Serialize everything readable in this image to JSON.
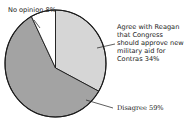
{
  "chart_data": {
    "type": "pie",
    "title": "",
    "start_angle_deg": 0,
    "direction": "clockwise",
    "slices": [
      {
        "label": "Agree with Reagan that Congress should approve new military aid for Contras",
        "value": 34,
        "display": "34%",
        "color": "#d6d6d6"
      },
      {
        "label": "Disagree",
        "value": 59,
        "display": "59%",
        "color": "#a3a3a3"
      },
      {
        "label": "No opinion",
        "value": 8,
        "display": "8%",
        "color": "#ffffff"
      }
    ],
    "legend": "none (direct labels with leader lines)"
  },
  "labels": {
    "no_opinion": "No opinion 8%",
    "agree_lines": [
      "Agree with Reagan",
      "that Congress",
      "should approve new",
      "military aid for",
      "Contras 34%"
    ],
    "disagree": "Disagree 59%"
  }
}
